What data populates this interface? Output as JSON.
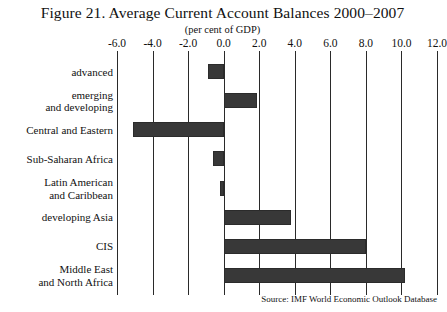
{
  "figure": {
    "title": "Figure 21. Average Current Account Balances 2000–2007",
    "subtitle": "(per cent of GDP)",
    "source": "Source: IMF World Economic Outlook Database"
  },
  "chart_data": {
    "type": "bar",
    "orientation": "horizontal",
    "title": "Figure 21. Average Current Account Balances 2000–2007",
    "subtitle": "(per cent of GDP)",
    "xlabel": "",
    "ylabel": "",
    "xlim": [
      -6.0,
      12.0
    ],
    "xticks": [
      -6.0,
      -4.0,
      -2.0,
      0.0,
      2.0,
      4.0,
      6.0,
      8.0,
      10.0,
      12.0
    ],
    "xticklabels": [
      "-6.0",
      "-4.0",
      "-2.0",
      "0.0",
      "2.0",
      "4.0",
      "6.0",
      "8.0",
      "10.0",
      "12.0"
    ],
    "grid": "vertical",
    "legend": "none",
    "bar_color": "#383838",
    "categories": [
      "advanced",
      "emerging\nand developing",
      "Central and Eastern",
      "Sub-Saharan Africa",
      "Latin American\nand Caribbean",
      "developing Asia",
      "CIS",
      "Middle East\nand North Africa"
    ],
    "values": [
      -0.9,
      1.9,
      -5.1,
      -0.6,
      -0.2,
      3.8,
      8.0,
      10.2
    ],
    "source": "Source: IMF World Economic Outlook Database"
  }
}
